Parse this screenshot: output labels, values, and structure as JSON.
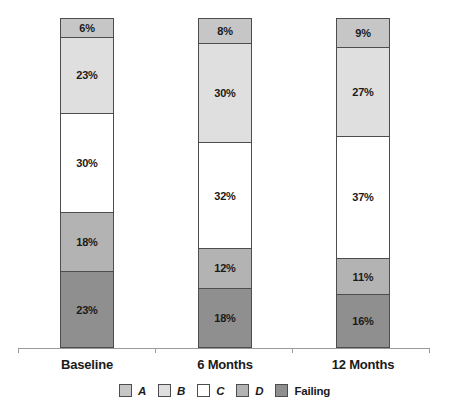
{
  "chart_data": {
    "type": "bar",
    "subtype": "stacked-100-percent",
    "categories": [
      "Baseline",
      "6 Months",
      "12 Months"
    ],
    "series": [
      {
        "name": "A",
        "values": [
          6,
          8,
          9
        ],
        "color": "#c6c6c6",
        "italic": true
      },
      {
        "name": "B",
        "values": [
          23,
          30,
          27
        ],
        "color": "#dfdfdf",
        "italic": true
      },
      {
        "name": "C",
        "values": [
          30,
          32,
          37
        ],
        "color": "#ffffff",
        "italic": true
      },
      {
        "name": "D",
        "values": [
          18,
          12,
          11
        ],
        "color": "#b3b3b3",
        "italic": true
      },
      {
        "name": "Failing",
        "values": [
          23,
          18,
          16
        ],
        "color": "#8f8f8f",
        "italic": false
      }
    ],
    "stack_order_top_to_bottom": [
      "A",
      "B",
      "C",
      "D",
      "Failing"
    ],
    "value_label_format": "{v}%",
    "legend_position": "bottom",
    "grid": false,
    "ylim": [
      0,
      100
    ]
  },
  "colors": {
    "segment_border": "#4d4d4d",
    "axis": "#9a9a9a",
    "text": "#1a1a1a",
    "background": "#ffffff"
  }
}
